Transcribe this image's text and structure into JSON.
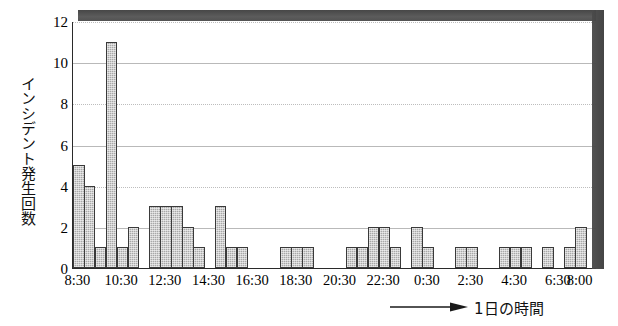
{
  "chart_data": {
    "type": "bar",
    "title": "",
    "subtitle": "",
    "xlabel": "1日の時間",
    "ylabel": "インシデント発生回数",
    "ylim": [
      0,
      12
    ],
    "yticks": [
      0,
      2,
      4,
      6,
      8,
      10,
      12
    ],
    "ytick_labels": [
      "0",
      "2",
      "4",
      "6",
      "8",
      "10",
      "12"
    ],
    "grid": true,
    "legend": null,
    "bar_color": "#a8a8a8",
    "bar_edge_color": "#3a3a3a",
    "axis_color": "#2a2a2a",
    "grid_color": "#b9b9b9",
    "bin_minutes": 30,
    "x_start": "8:30",
    "x_end": "8:00",
    "xtick_labels": [
      "8:30",
      "10:30",
      "12:30",
      "14:30",
      "16:30",
      "18:30",
      "20:30",
      "22:30",
      "0:30",
      "2:30",
      "4:30",
      "6:30",
      "8:00"
    ],
    "categories": [
      "8:30",
      "9:00",
      "9:30",
      "10:00",
      "10:30",
      "11:00",
      "11:30",
      "12:00",
      "12:30",
      "13:00",
      "13:30",
      "14:00",
      "14:30",
      "15:00",
      "15:30",
      "16:00",
      "16:30",
      "17:00",
      "17:30",
      "18:00",
      "18:30",
      "19:00",
      "19:30",
      "20:00",
      "20:30",
      "21:00",
      "21:30",
      "22:00",
      "22:30",
      "23:00",
      "23:30",
      "0:00",
      "0:30",
      "1:00",
      "1:30",
      "2:00",
      "2:30",
      "3:00",
      "3:30",
      "4:00",
      "4:30",
      "5:00",
      "5:30",
      "6:00",
      "6:30",
      "7:00",
      "7:30",
      "8:00"
    ],
    "values": [
      5,
      4,
      1,
      11,
      1,
      2,
      0,
      3,
      3,
      3,
      2,
      1,
      0,
      3,
      1,
      1,
      0,
      0,
      0,
      1,
      1,
      1,
      0,
      0,
      0,
      1,
      1,
      2,
      2,
      1,
      0,
      2,
      1,
      0,
      0,
      1,
      1,
      0,
      0,
      1,
      1,
      1,
      0,
      1,
      0,
      1,
      2,
      0
    ],
    "annotations": [
      {
        "name": "x-axis-arrow",
        "text": "⟶"
      }
    ]
  },
  "artifacts": {
    "top_band_label": "scan-artifact-top-band",
    "right_band_label": "scan-artifact-right-band"
  }
}
